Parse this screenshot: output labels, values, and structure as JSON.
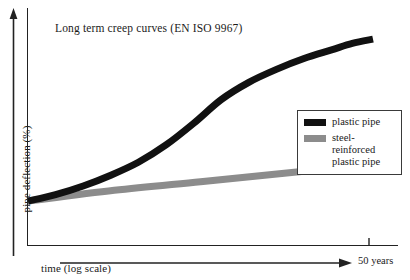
{
  "chart_data": {
    "type": "line",
    "title": "Long term creep curves (EN ISO 9967)",
    "xlabel": "time (log scale)",
    "ylabel": "pipe deflection (%)",
    "x_tick_labels": [
      "50 years"
    ],
    "grid": false,
    "legend_position": "right-middle",
    "axis_note": "axes unlabelled / schematic; x is logarithmic time, y is pipe deflection in percent",
    "series": [
      {
        "name": "plastic pipe",
        "color": "#111111",
        "x": [
          0,
          0.08,
          0.16,
          0.24,
          0.32,
          0.4,
          0.48,
          0.56,
          0.64,
          0.72,
          0.8,
          0.88,
          0.94,
          1.0
        ],
        "y": [
          0.18,
          0.21,
          0.25,
          0.3,
          0.36,
          0.44,
          0.54,
          0.65,
          0.73,
          0.79,
          0.84,
          0.88,
          0.91,
          0.93
        ]
      },
      {
        "name": "steel-reinforced plastic pipe",
        "color": "#8c8c8c",
        "x": [
          0,
          0.25,
          0.5,
          0.75,
          1.0
        ],
        "y": [
          0.18,
          0.23,
          0.27,
          0.31,
          0.35
        ]
      }
    ]
  },
  "title": {
    "text": "Long term creep curves (EN ISO 9967)"
  },
  "axes": {
    "y_label": "pipe deflection (%)",
    "x_label": "time (log scale)",
    "x_tick_label": "50 years"
  },
  "legend": {
    "items": [
      {
        "label": "plastic pipe",
        "color": "#111111",
        "swatch": "black-line-swatch"
      },
      {
        "label": "steel-reinforced plastic pipe",
        "color": "#8c8c8c",
        "swatch": "gray-line-swatch"
      }
    ]
  },
  "colors": {
    "plastic_pipe": "#111111",
    "steel_reinforced": "#8c8c8c",
    "axis": "#222222",
    "background": "#ffffff"
  }
}
